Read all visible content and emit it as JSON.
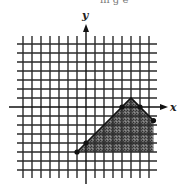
{
  "top_fragment": "in g e",
  "graph": {
    "x_label": "x",
    "y_label": "y",
    "origin_px": [
      86,
      107
    ],
    "unit_px": 9,
    "x_range": [
      -7,
      8
    ],
    "y_range": [
      -7,
      7
    ],
    "colors": {
      "grid": "#2a2a2a",
      "axis": "#111111",
      "shade": "#555555",
      "background": "#ffffff"
    },
    "shaded_region_vertices": [
      [
        -1,
        -5
      ],
      [
        5,
        1
      ],
      [
        7.5,
        -1.5
      ],
      [
        7.5,
        -5
      ]
    ],
    "marked_points": [
      [
        0,
        -4
      ],
      [
        4,
        0
      ],
      [
        6,
        0
      ],
      [
        7.5,
        -1.5
      ],
      [
        -1,
        -5
      ]
    ]
  }
}
